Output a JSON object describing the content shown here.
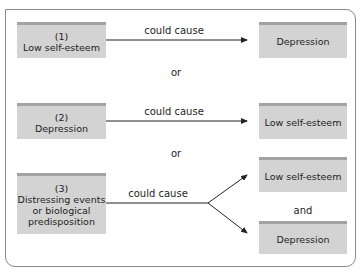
{
  "diagram": {
    "type": "causal-alternatives",
    "scenarios": [
      {
        "number": "(1)",
        "cause": "Low self-esteem",
        "relation": "could cause",
        "effects": [
          "Depression"
        ]
      },
      {
        "number": "(2)",
        "cause": "Depression",
        "relation": "could cause",
        "effects": [
          "Low self-esteem"
        ]
      },
      {
        "number": "(3)",
        "cause_lines": [
          "Distressing events",
          "or biological",
          "predisposition"
        ],
        "relation": "could cause",
        "effects": [
          "Low self-esteem",
          "Depression"
        ],
        "effects_joiner": "and"
      }
    ],
    "separators": [
      "or",
      "or"
    ]
  },
  "colors": {
    "box_fill": "#d3d3d3",
    "box_top_band": "#a3a3a3",
    "frame_border": "#8a8a8a",
    "arrow": "#222222"
  }
}
